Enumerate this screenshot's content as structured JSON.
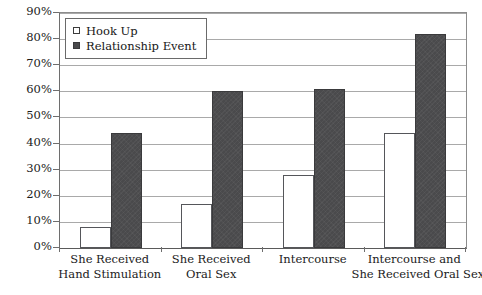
{
  "chart_data": {
    "type": "bar",
    "title": "",
    "subtitle": "",
    "xlabel": "",
    "ylabel": "",
    "ylim": [
      0,
      90
    ],
    "ytick_labels": [
      "0%",
      "10%",
      "20%",
      "30%",
      "40%",
      "50%",
      "60%",
      "70%",
      "80%",
      "90%"
    ],
    "ytick_values": [
      0,
      10,
      20,
      30,
      40,
      50,
      60,
      70,
      80,
      90
    ],
    "grid": true,
    "legend_position": "top-left-inside",
    "categories": [
      "She Received Hand Stimulation",
      "She Received Oral Sex",
      "Intercourse",
      "Intercourse and She Received Oral Sex"
    ],
    "category_lines": [
      [
        "She Received",
        "Hand Stimulation"
      ],
      [
        "She Received",
        "Oral Sex"
      ],
      [
        "Intercourse"
      ],
      [
        "Intercourse and",
        "She Received Oral Sex"
      ]
    ],
    "series": [
      {
        "name": "Hook Up",
        "marker": "open-square",
        "color": "#ffffff",
        "edge_color": "#55565a",
        "values": [
          8,
          17,
          28,
          44
        ]
      },
      {
        "name": "Relationship Event",
        "marker": "filled-square",
        "color": "#4a4a4c",
        "edge_color": "#3a3a3c",
        "values": [
          44,
          60,
          61,
          82
        ]
      }
    ]
  },
  "legend": {
    "items": [
      {
        "label": "Hook Up"
      },
      {
        "label": "Relationship Event"
      }
    ]
  },
  "colors": {
    "hook_up": "#ffffff",
    "relationship_event": "#4a4a4c",
    "gridline": "#a9a9a9",
    "axis": "#6e6e6e",
    "background": "#ffffff"
  }
}
